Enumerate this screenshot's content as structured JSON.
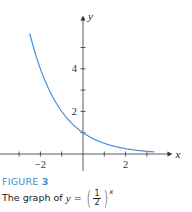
{
  "chart_data": {
    "type": "line",
    "title": "",
    "function": "y = (1/2)^x",
    "base": 0.5,
    "xlabel": "x",
    "ylabel": "y",
    "xlim": [
      -3.9,
      4.2
    ],
    "ylim": [
      -0.8,
      6.5
    ],
    "x_domain": [
      -2.5,
      3.35
    ],
    "x_ticks": [
      -3,
      -2,
      -1,
      0,
      1,
      2,
      3
    ],
    "x_tick_labels": [
      {
        "value": -2,
        "text": "−2"
      },
      {
        "value": 2,
        "text": "2"
      }
    ],
    "y_ticks": [
      1,
      2,
      3,
      4,
      5
    ],
    "y_tick_labels": [
      {
        "value": 2,
        "text": "2"
      },
      {
        "value": 4,
        "text": "4"
      }
    ],
    "y_intercept": {
      "x": 0,
      "y": 1
    },
    "grid": false,
    "colors": {
      "curve": "#4a90d9",
      "axis": "#333333"
    }
  },
  "caption": {
    "figure_label": "FIGURE",
    "figure_number": "3",
    "text_prefix": "The graph of",
    "var": "y",
    "equals": "=",
    "numerator": "1",
    "denominator": "2",
    "exponent": "x"
  }
}
